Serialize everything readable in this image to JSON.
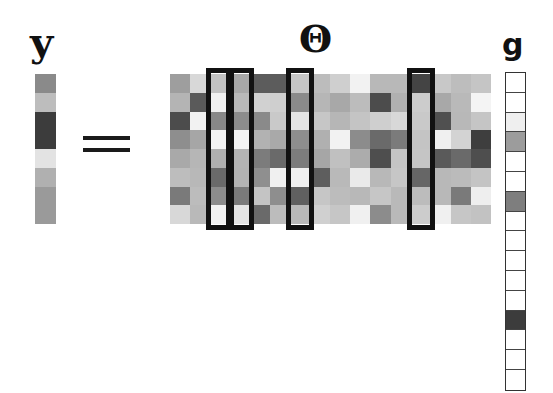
{
  "equation": {
    "y_label": "y",
    "theta_label": "Θ",
    "g_label": "g",
    "operator": "="
  },
  "y_vector": {
    "cells": [
      "#8a8a8a",
      "#bdbdbd",
      "#3c3c3c",
      "#3c3c3c",
      "#e3e3e3",
      "#b0b0b0",
      "#9a9a9a",
      "#9a9a9a"
    ],
    "rows": 8
  },
  "theta_matrix": {
    "rows": 8,
    "cols": 16,
    "cells": [
      [
        "#9e9e9e",
        "#d8d8d8",
        "#c2c2c2",
        "#a8a8a8",
        "#5c5c5c",
        "#5c5c5c",
        "#c6c6c6",
        "#bcbcbc",
        "#cfcfcf",
        "#f2f2f2",
        "#b8b8b8",
        "#b8b8b8",
        "#444444",
        "#c8c8c8",
        "#bdbdbd",
        "#c5c5c5"
      ],
      [
        "#b4b4b4",
        "#5a5a5a",
        "#f0f0f0",
        "#b9b9b9",
        "#d1d1d1",
        "#cfcfcf",
        "#8a8a8a",
        "#b6b6b6",
        "#a8a8a8",
        "#bcbcbc",
        "#4c4c4c",
        "#b0b0b0",
        "#cccccc",
        "#a8a8a8",
        "#b9b9b9",
        "#f4f4f4"
      ],
      [
        "#4c4c4c",
        "#f2f2f2",
        "#888888",
        "#8c8c8c",
        "#8a8a8a",
        "#c9c9c9",
        "#e4e4e4",
        "#c6c6c6",
        "#b6b6b6",
        "#c4c4c4",
        "#cfcfcf",
        "#d8d8d8",
        "#c9c9c9",
        "#505050",
        "#b8b8b8",
        "#c5c5c5"
      ],
      [
        "#8e8e8e",
        "#a6a6a6",
        "#f3f3f3",
        "#f3f3f3",
        "#b2b2b2",
        "#a9a9a9",
        "#8e8e8e",
        "#b0b0b0",
        "#f2f2f2",
        "#8c8c8c",
        "#6a6a6a",
        "#7b7b7b",
        "#c4c4c4",
        "#f0f0f0",
        "#d3d3d3",
        "#3e3e3e"
      ],
      [
        "#a9a9a9",
        "#b6b6b6",
        "#b0b0b0",
        "#b4b4b4",
        "#7c7c7c",
        "#6a6a6a",
        "#7c7c7c",
        "#a6a6a6",
        "#c0c0c0",
        "#acacac",
        "#4e4e4e",
        "#c4c4c4",
        "#c5c5c5",
        "#5a5a5a",
        "#6a6a6a",
        "#4e4e4e"
      ],
      [
        "#bdbdbd",
        "#b8b8b8",
        "#6a6a6a",
        "#b3b3b3",
        "#8f8f8f",
        "#f0f0f0",
        "#f0f0f0",
        "#5e5e5e",
        "#b9b9b9",
        "#eaeaea",
        "#b8b8b8",
        "#c6c6c6",
        "#666666",
        "#b8b8b8",
        "#bbbbbb",
        "#c4c4c4"
      ],
      [
        "#7a7a7a",
        "#bcbcbc",
        "#8c8c8c",
        "#7a7a7a",
        "#c4c4c4",
        "#8e8e8e",
        "#606060",
        "#c6c6c6",
        "#bcbcbc",
        "#b8b8b8",
        "#c6c6c6",
        "#b9b9b9",
        "#bcbcbc",
        "#b8b8b8",
        "#7a7a7a",
        "#eeeeee"
      ],
      [
        "#d8d8d8",
        "#b9b9b9",
        "#f2f2f2",
        "#e4e4e4",
        "#6a6a6a",
        "#bcbcbc",
        "#b9b9b9",
        "#d0d0d0",
        "#c6c6c6",
        "#f0f0f0",
        "#8c8c8c",
        "#b9b9b9",
        "#cccccc",
        "#f0f0f0",
        "#c6c6c6",
        "#c2c2c2"
      ]
    ],
    "highlighted_columns": [
      2,
      3,
      6,
      12
    ]
  },
  "g_vector": {
    "rows": 16,
    "cells": [
      "#ffffff",
      "#ffffff",
      "#efefef",
      "#9c9c9c",
      "#ffffff",
      "#ffffff",
      "#7e7e7e",
      "#ffffff",
      "#ffffff",
      "#ffffff",
      "#ffffff",
      "#ffffff",
      "#3c3c3c",
      "#ffffff",
      "#ffffff",
      "#ffffff"
    ]
  },
  "colors": {
    "ink": "#111111",
    "background": "#ffffff"
  }
}
